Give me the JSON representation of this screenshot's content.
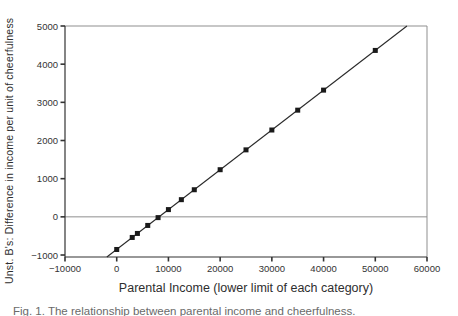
{
  "figure": {
    "x_axis_title": "Parental Income (lower limit of each category)",
    "y_axis_title": "Unst. B's: Difference in income per unit of cheerfulness",
    "caption": "Fig. 1. The relationship between parental income and cheerfulness."
  },
  "chart_data": {
    "type": "scatter",
    "title": "",
    "xlabel": "Parental Income (lower limit of each category)",
    "ylabel": "Unst. B's: Difference in income per unit of cheerfulness",
    "xlim": [
      -10000,
      60000
    ],
    "ylim": [
      -1052,
      5000
    ],
    "x_ticks": [
      -10000,
      0,
      10000,
      20000,
      30000,
      40000,
      50000,
      60000
    ],
    "y_ticks": [
      -1000,
      0,
      1000,
      2000,
      3000,
      4000,
      5000
    ],
    "grid": false,
    "legend": false,
    "marker": "filled-square",
    "points": [
      [
        0,
        -855
      ],
      [
        3000,
        -540
      ],
      [
        4000,
        -435
      ],
      [
        6000,
        -225
      ],
      [
        8000,
        -20
      ],
      [
        10000,
        190
      ],
      [
        12500,
        450
      ],
      [
        15000,
        710
      ],
      [
        20000,
        1235
      ],
      [
        25000,
        1755
      ],
      [
        30000,
        2275
      ],
      [
        35000,
        2795
      ],
      [
        40000,
        3320
      ],
      [
        50000,
        4360
      ]
    ],
    "fit_line": {
      "slope": 0.1043,
      "intercept": -853
    },
    "reference_line_y": 0,
    "colors": {
      "marker": "#1a1a1a",
      "fit_line": "#2a2a2a",
      "axis": "#333333",
      "box_border": "#8f8f8f",
      "reference_line": "#8f8f8f",
      "tick_text": "#333333",
      "background": "#ffffff"
    }
  }
}
